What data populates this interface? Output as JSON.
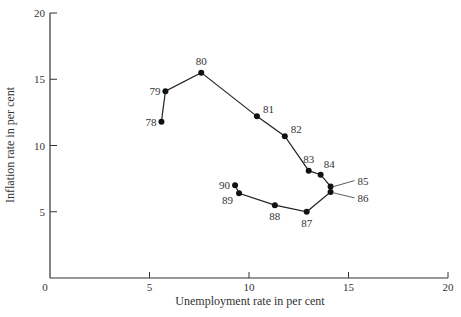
{
  "chart_data": {
    "type": "line",
    "title": "",
    "xlabel": "Unemployment rate in per cent",
    "ylabel": "Inflation rate in per cent",
    "xlim": [
      0,
      20
    ],
    "ylim": [
      0,
      20
    ],
    "x_ticks": [
      0,
      5,
      10,
      15,
      20
    ],
    "y_ticks": [
      5,
      10,
      15,
      20
    ],
    "grid": false,
    "legend": null,
    "series": [
      {
        "name": "Unemployment vs inflation, 1978-1990",
        "points": [
          {
            "label": "78",
            "x": 5.6,
            "y": 11.8
          },
          {
            "label": "79",
            "x": 5.8,
            "y": 14.1
          },
          {
            "label": "80",
            "x": 7.6,
            "y": 15.5
          },
          {
            "label": "81",
            "x": 10.4,
            "y": 12.2
          },
          {
            "label": "82",
            "x": 11.8,
            "y": 10.7
          },
          {
            "label": "83",
            "x": 13.0,
            "y": 8.1
          },
          {
            "label": "84",
            "x": 13.6,
            "y": 7.8
          },
          {
            "label": "85",
            "x": 14.1,
            "y": 6.9
          },
          {
            "label": "86",
            "x": 14.1,
            "y": 6.5
          },
          {
            "label": "87",
            "x": 12.9,
            "y": 5.0
          },
          {
            "label": "88",
            "x": 11.3,
            "y": 5.5
          },
          {
            "label": "89",
            "x": 9.5,
            "y": 6.4
          },
          {
            "label": "90",
            "x": 9.3,
            "y": 7.0
          }
        ]
      }
    ]
  }
}
